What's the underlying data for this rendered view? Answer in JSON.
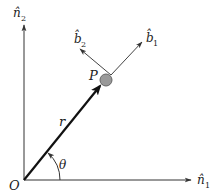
{
  "diagram": {
    "colors": {
      "axis": "#333333",
      "radius": "#111111",
      "point_fill": "#999999",
      "point_stroke": "#555555",
      "unit_vector": "#444444",
      "text": "#222222"
    },
    "labels": {
      "origin": "O",
      "point": "P",
      "radius": "r",
      "angle": "θ",
      "n1_base": "n̂",
      "n1_sub": "1",
      "n2_base": "n̂",
      "n2_sub": "2",
      "b1_base": "b̂",
      "b1_sub": "1",
      "b2_base": "b̂",
      "b2_sub": "2"
    },
    "geometry": {
      "origin": [
        24,
        180
      ],
      "n1_tip": [
        192,
        180
      ],
      "n2_tip": [
        24,
        24
      ],
      "point_P": [
        105,
        80
      ],
      "point_radius": 6,
      "b_vertex": [
        111,
        75
      ],
      "b1_tip": [
        143,
        41
      ],
      "b2_tip": [
        79,
        48
      ],
      "angle_arc_radius": 36
    }
  }
}
